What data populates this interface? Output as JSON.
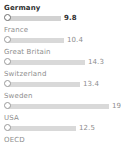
{
  "chart_data": {
    "type": "bar",
    "orientation": "horizontal",
    "title": "",
    "xlabel": "",
    "ylabel": "",
    "grid": false,
    "legend": null,
    "xlim": [
      0,
      21.5
    ],
    "categories": [
      "Germany",
      "France",
      "Great Britain",
      "Switzerland",
      "Sweden",
      "USA",
      "OECD"
    ],
    "values": [
      9.8,
      10.4,
      14.3,
      13.4,
      19.5,
      12.5,
      null
    ],
    "value_labels": [
      "9.8",
      "10.4",
      "14.3",
      "13.4",
      "19.5",
      "12.5",
      ""
    ],
    "highlighted": "Germany",
    "rows": [
      {
        "label": "Germany",
        "value": 9.8,
        "value_label": "9.8",
        "bar_px": 53,
        "highlight": true,
        "has_bar": true
      },
      {
        "label": "France",
        "value": 10.4,
        "value_label": "10.4",
        "bar_px": 56,
        "highlight": false,
        "has_bar": true
      },
      {
        "label": "Great Britain",
        "value": 14.3,
        "value_label": "14.3",
        "bar_px": 77,
        "highlight": false,
        "has_bar": true
      },
      {
        "label": "Switzerland",
        "value": 13.4,
        "value_label": "13.4",
        "bar_px": 72,
        "highlight": false,
        "has_bar": true
      },
      {
        "label": "Sweden",
        "value": 19.5,
        "value_label": "19.5",
        "bar_px": 101,
        "highlight": false,
        "has_bar": true
      },
      {
        "label": "USA",
        "value": 12.5,
        "value_label": "12.5",
        "bar_px": 68,
        "highlight": false,
        "has_bar": true
      },
      {
        "label": "OECD",
        "value": null,
        "value_label": "",
        "bar_px": 0,
        "highlight": false,
        "has_bar": false
      }
    ]
  },
  "colors": {
    "background": "#ffffff",
    "bar": "#d9d9d9",
    "label": "#8d8d8d",
    "label_highlight": "#2f2f2f",
    "marker_stroke": "#9a9a9a"
  }
}
